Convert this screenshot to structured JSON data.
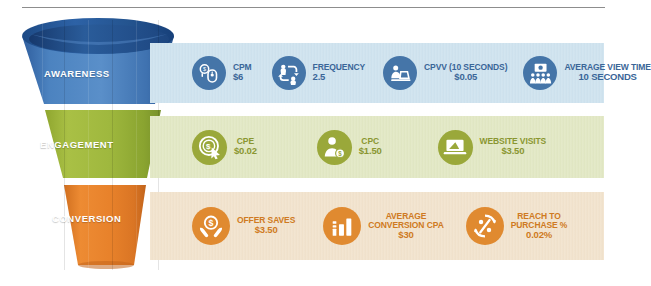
{
  "funnel": {
    "title": "Marketing Funnel Metrics",
    "stages": [
      {
        "key": "awareness",
        "label": "AWARENESS",
        "funnel_color": "#4a7fbf",
        "band_color": "#cfe3ef",
        "icon_color": "#4575a8",
        "text_color": "#3a6698",
        "metrics": [
          {
            "icon": "mouse-click-cost-icon",
            "name": "CPM",
            "value": "$6"
          },
          {
            "icon": "frequency-cycle-icon",
            "name": "Frequency",
            "value": "2.5"
          },
          {
            "icon": "person-laptop-icon",
            "name": "CPVV (10 SECONDS)",
            "value": "$0.05"
          },
          {
            "icon": "audience-screen-icon",
            "name": "AVERAGE VIEW TIME",
            "value": "10 SECONDS"
          }
        ]
      },
      {
        "key": "engagement",
        "label": "ENGAGEMENT",
        "funnel_color": "#9fb53c",
        "band_color": "#e2e8c4",
        "icon_color": "#9aa83a",
        "text_color": "#8a9631",
        "metrics": [
          {
            "icon": "cost-per-engagement-icon",
            "name": "CPE",
            "value": "$0.02"
          },
          {
            "icon": "person-dollar-icon",
            "name": "CPC",
            "value": "$1.50"
          },
          {
            "icon": "laptop-icon",
            "name": "WEBSITE VISITS",
            "value": "$3.50"
          }
        ]
      },
      {
        "key": "conversion",
        "label": "CONVERSION",
        "funnel_color": "#e27d29",
        "band_color": "#f2e3cd",
        "icon_color": "#e08a30",
        "text_color": "#cf7a22",
        "metrics": [
          {
            "icon": "hands-holding-coin-icon",
            "name": "OFFER SAVES",
            "value": "$3.50"
          },
          {
            "icon": "bar-chart-icon",
            "name": "AVERAGE CONVERSION CPA",
            "value": "$30"
          },
          {
            "icon": "percent-arrows-icon",
            "name": "REACH TO PURCHASE %",
            "value": "0.02%"
          }
        ]
      }
    ]
  },
  "metric_labels": {
    "cpm_name": "CPM",
    "cpm_value": "$6",
    "frequency_name": "FREQUENCY",
    "frequency_value": "2.5",
    "cpvv_name_line1": "CPVV (10 SECONDS)",
    "cpvv_value": "$0.05",
    "avt_name_line1": "AVERAGE VIEW TIME",
    "avt_value": "10 SECONDS",
    "cpe_name": "CPE",
    "cpe_value": "$0.02",
    "cpc_name": "CPC",
    "cpc_value": "$1.50",
    "website_visits_name": "WEBSITE VISITS",
    "website_visits_value": "$3.50",
    "offer_saves_name": "OFFER SAVES",
    "offer_saves_value": "$3.50",
    "avg_cpa_name_line1": "AVERAGE",
    "avg_cpa_name_line2": "CONVERSION CPA",
    "avg_cpa_value": "$30",
    "reach_name_line1": "REACH TO",
    "reach_name_line2": "PURCHASE %",
    "reach_value": "0.02%"
  },
  "stage_labels": {
    "awareness": "AWARENESS",
    "engagement": "ENGAGEMENT",
    "conversion": "CONVERSION"
  }
}
